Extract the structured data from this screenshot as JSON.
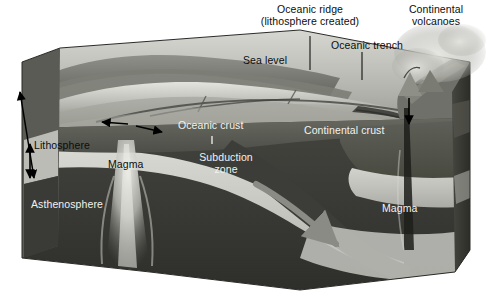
{
  "figure": {
    "type": "geological cross-section block diagram",
    "background_color": "#ffffff",
    "width": 487,
    "height": 303
  },
  "palette": {
    "background": "#ffffff",
    "ocean_surface": "#b9bab4",
    "seafloor_light": "#d8d8d2",
    "seafloor_mid": "#9a9b95",
    "seafloor_dark": "#6e6f6a",
    "oceanic_crust": "#595a55",
    "continental_crust": "#54554f",
    "lithosphere_band": "#c8c8c4",
    "asthenosphere": "#3a3a38",
    "slab_dark": "#44443f",
    "magma_light": "#dedeD8",
    "right_face": "#3e3e3a",
    "label_dark": "#0d0d0d",
    "label_light": "#f2f2ef",
    "arrow_black": "#000000",
    "arrow_gray": "#8a8b85",
    "plume": "#c9c9c4"
  },
  "labels": {
    "oceanic_ridge": {
      "line1": "Oceanic ridge",
      "line2": "(lithosphere created)",
      "color": "#0d0d0d",
      "leader": true
    },
    "continental_volcanoes": {
      "line1": "Continental",
      "line2": "volcanoes",
      "color": "#0d0d0d",
      "leader": false
    },
    "oceanic_trench": {
      "text": "Oceanic trench",
      "color": "#0d0d0d",
      "leader": true
    },
    "sea_level": {
      "text": "Sea level",
      "color": "#0d0d0d",
      "leader": false
    },
    "oceanic_crust": {
      "text": "Oceanic crust",
      "color": "#f2f2ef",
      "leader": true
    },
    "continental_crust": {
      "text": "Continental crust",
      "color": "#f2f2ef",
      "leader": false
    },
    "subduction_zone": {
      "line1": "Subduction",
      "line2": "zone",
      "color": "#f2f2ef",
      "leader": false
    },
    "lithosphere": {
      "text": "Lithosphere",
      "color": "#0d0d0d",
      "leader": false
    },
    "asthenosphere": {
      "text": "Asthenosphere",
      "color": "#f2f2ef",
      "leader": false
    },
    "magma_left": {
      "text": "Magma",
      "color": "#0d0d0d",
      "leader": false
    },
    "magma_right": {
      "text": "Magma",
      "color": "#f2f2ef",
      "leader": false
    }
  },
  "annotations": {
    "lithosphere_thickness_arrow": "double-headed vertical arrow spanning lithosphere on left face",
    "spreading_arrow_left": "arrow pointing left away from ridge axis",
    "spreading_arrow_right": "arrow pointing right away from ridge axis",
    "slab_descent_arrow": "gray arrow along descending slab into asthenosphere",
    "volcano_feed_arrow": "downward arrow from continental volcano into crust"
  }
}
